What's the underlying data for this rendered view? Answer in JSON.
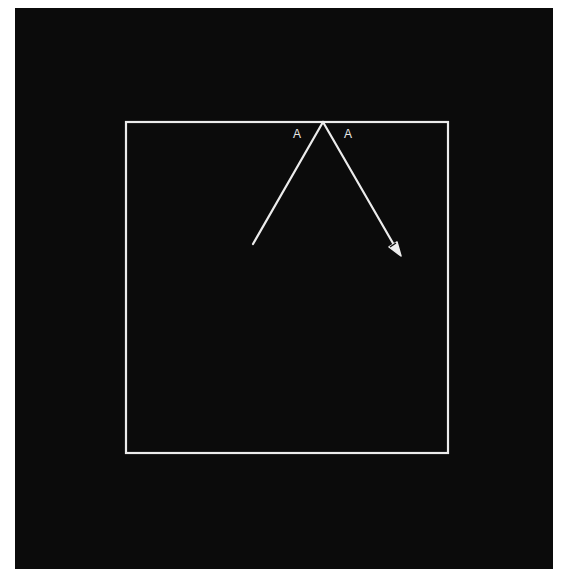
{
  "diagram": {
    "type": "reflection",
    "background_color": "#0b0b0b",
    "line_color": "#ececec",
    "box": {
      "x1": 126,
      "y1": 122,
      "x2": 448,
      "y2": 453
    },
    "incident_ray": {
      "from": [
        253,
        244
      ],
      "to": [
        323,
        122
      ]
    },
    "reflected_ray": {
      "from": [
        323,
        122
      ],
      "to": [
        401,
        256
      ]
    },
    "labels": {
      "angle_left": "A",
      "angle_right": "A"
    }
  }
}
